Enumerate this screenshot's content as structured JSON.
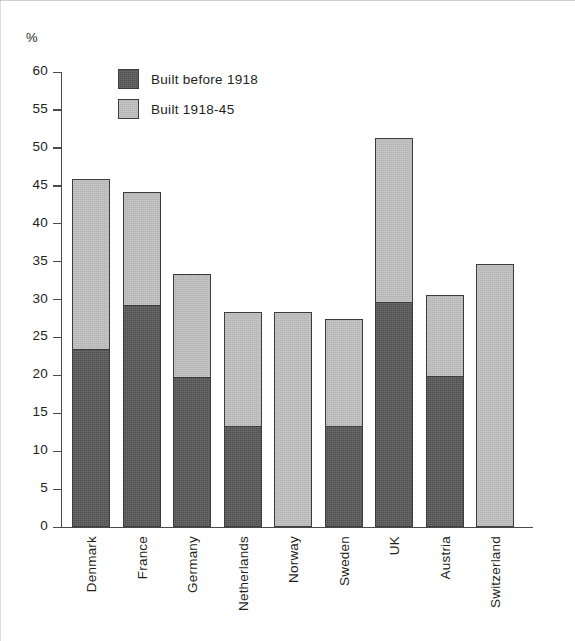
{
  "chart_data": {
    "type": "bar",
    "stacked": true,
    "title": "",
    "subtitle": "",
    "xlabel": "",
    "ylabel": "%",
    "unit_label": "%",
    "ylim": [
      0,
      60
    ],
    "ytick_step": 5,
    "yticks": [
      60,
      55,
      50,
      45,
      40,
      35,
      30,
      25,
      20,
      15,
      10,
      5,
      0
    ],
    "grid": false,
    "legend_position": "upper-left inside plot",
    "categories": [
      "Denmark",
      "France",
      "Germany",
      "Netherlands",
      "Norway",
      "Sweden",
      "UK",
      "Austria",
      "Switzerland"
    ],
    "series": [
      {
        "name": "Built before 1918",
        "color": "#4f4f4f",
        "values": [
          23.3,
          29.1,
          19.7,
          13.2,
          0.0,
          13.2,
          29.6,
          19.8,
          0.0
        ]
      },
      {
        "name": "Built 1918-45",
        "color": "#b3b3b3",
        "values": [
          22.6,
          15.1,
          13.6,
          15.2,
          28.3,
          14.2,
          21.7,
          10.8,
          34.7
        ]
      }
    ],
    "totals": [
      45.9,
      44.2,
      33.3,
      28.4,
      28.3,
      27.4,
      51.3,
      30.6,
      34.7
    ]
  },
  "legend": {
    "items": [
      {
        "label": "Built before 1918",
        "swatch": "dark-swatch-icon"
      },
      {
        "label": "Built 1918-45",
        "swatch": "light-swatch-icon"
      }
    ]
  },
  "colors": {
    "dark_fill": "#4f4f4f",
    "light_fill": "#b3b3b3",
    "outline": "#3d3d3d",
    "axis": "#4a4a4a",
    "text": "#231f20",
    "background": "#ffffff"
  }
}
